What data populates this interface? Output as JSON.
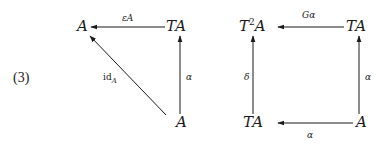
{
  "equation_number": "(3)",
  "diagrams": [
    {
      "name": "triangle",
      "objects": {
        "top_left": "A",
        "top_right": "TA",
        "bottom_right": "A"
      },
      "arrows": [
        {
          "from": "top_right",
          "to": "top_left",
          "label": "εA"
        },
        {
          "from": "bottom_right",
          "to": "top_left",
          "label": "id",
          "label_subscript": "A"
        },
        {
          "from": "bottom_right",
          "to": "top_right",
          "label": "α"
        }
      ]
    },
    {
      "name": "square",
      "objects": {
        "top_left_base": "T",
        "top_left_sup": "2",
        "top_left_rest": "A",
        "top_right": "TA",
        "bottom_left": "TA",
        "bottom_right": "A"
      },
      "arrows": [
        {
          "from": "top_right",
          "to": "top_left",
          "label": "Gα"
        },
        {
          "from": "bottom_left",
          "to": "top_left",
          "label": "δ"
        },
        {
          "from": "bottom_right",
          "to": "top_right",
          "label": "α"
        },
        {
          "from": "bottom_right",
          "to": "bottom_left",
          "label": "α"
        }
      ]
    }
  ]
}
